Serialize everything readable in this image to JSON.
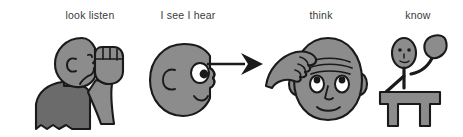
{
  "figure": {
    "type": "pictogram-sequence",
    "background_color": "#ffffff",
    "panels": [
      {
        "id": "look-listen",
        "label": "look listen",
        "icon_name": "person-hand-to-ear-icon",
        "description": "side view of a person with a raised fist held near the ear"
      },
      {
        "id": "i-see-i-hear",
        "label": "I see I hear",
        "icon_name": "head-profile-eye-ear-icon",
        "description": "profile of a head showing one eye and an ear"
      },
      {
        "id": "think",
        "label": "think",
        "icon_name": "head-hand-on-forehead-icon",
        "description": "front view of a face with furrowed brow and a hand on the forehead"
      },
      {
        "id": "know",
        "label": "know",
        "icon_name": "stick-figure-raised-hand-at-desk-icon",
        "description": "stick figure seated at a desk raising one hand"
      }
    ],
    "connectors": [
      {
        "id": "arrow-1",
        "icon_name": "arrow-right-icon",
        "from": "i-see-i-hear",
        "to": "think"
      }
    ],
    "colors": {
      "outline": "#1a1a1a",
      "skin_fill": "#8c8c8c",
      "skin_shade": "#7d7d7d",
      "shirt_fill": "#6b6b6b",
      "desk_fill": "#8c8c8c",
      "eye_white": "#ffffff",
      "pupil": "#1a1a1a",
      "label_text": "#3a3a3a",
      "background": "#ffffff"
    }
  }
}
